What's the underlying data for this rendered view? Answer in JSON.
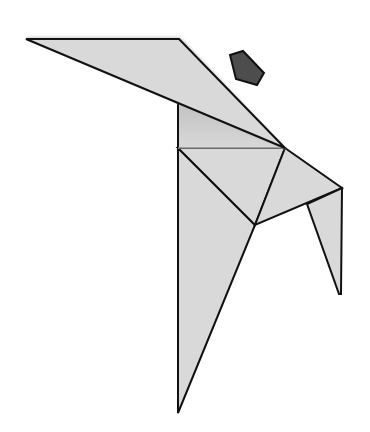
{
  "diagram": {
    "colors": {
      "paper": "#d9d9d9",
      "paper_shadow": "#c4c4c4",
      "crease": "#9a9a9a",
      "edge": "#111111",
      "arrow_fill": "#4d4d4d",
      "background": "#ffffff"
    },
    "parts": {
      "wing": "wing-flap",
      "body": "body",
      "head": "head",
      "leg": "leg",
      "arrow": "push-arrow"
    }
  }
}
